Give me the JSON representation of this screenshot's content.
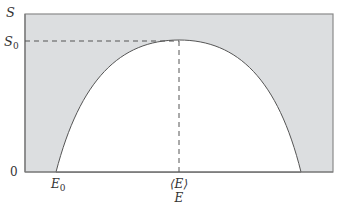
{
  "diagram": {
    "type": "entropy-vs-energy",
    "axes": {
      "y_label": "S",
      "x_label": "E",
      "origin_label": "0"
    },
    "markers": {
      "s0_label": "S",
      "s0_sub": "0",
      "e0_label": "E",
      "e0_sub": "0",
      "mean_e_label": "⟨E⟩"
    },
    "colors": {
      "fill": "#dcdee0",
      "stroke": "#555555",
      "axis": "#777777",
      "dash": "#555555"
    },
    "geometry": {
      "box": {
        "x0": 25,
        "y0": 14,
        "x1": 333,
        "y1": 172
      },
      "curve": {
        "left_root_x": 56,
        "peak_x": 179,
        "peak_y": 40,
        "right_root_x": 301
      }
    }
  }
}
